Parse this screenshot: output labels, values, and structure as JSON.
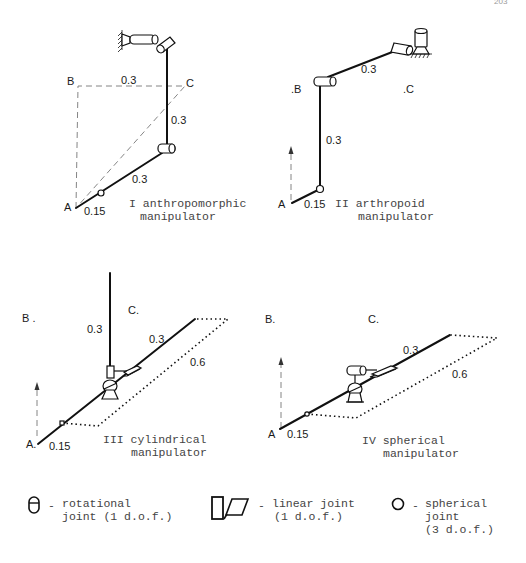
{
  "page_number": "203",
  "diagrams": [
    {
      "id": "I",
      "caption_line1": "I anthropomorphic",
      "caption_line2": "manipulator",
      "points": {
        "A": "A",
        "B": "B",
        "C": "C"
      },
      "dimensions": {
        "base": "0.15",
        "link1": "0.3",
        "link2": "0.3",
        "bc": "0.3"
      }
    },
    {
      "id": "II",
      "caption_line1": "II arthropoid",
      "caption_line2": "manipulator",
      "points": {
        "A": "A",
        "B": ".B",
        "C": ".C"
      },
      "dimensions": {
        "base": "0.15",
        "link1": "0.3",
        "link2": "0.3"
      }
    },
    {
      "id": "III",
      "caption_line1": "III cylindrical",
      "caption_line2": "manipulator",
      "points": {
        "A": "A.",
        "B": "B .",
        "C": "C."
      },
      "dimensions": {
        "base": "0.15",
        "vertical": "0.3",
        "arm": "0.3",
        "stroke": "0.6"
      }
    },
    {
      "id": "IV",
      "caption_line1": "IV spherical",
      "caption_line2": "manipulator",
      "points": {
        "A": "A",
        "B": "B.",
        "C": "C."
      },
      "dimensions": {
        "base": "0.15",
        "arm": "0.3",
        "stroke": "0.6"
      }
    }
  ],
  "legend": [
    {
      "icon": "rotational-joint-icon",
      "dash": "-",
      "line1": "rotational",
      "line2": "joint (1 d.o.f.)",
      "line3": ""
    },
    {
      "icon": "linear-joint-icon",
      "dash": "-",
      "line1": "linear joint",
      "line2": "(1 d.o.f.)",
      "line3": ""
    },
    {
      "icon": "spherical-joint-icon",
      "dash": "-",
      "line1": "spherical",
      "line2": "joint",
      "line3": "(3 d.o.f.)"
    }
  ]
}
